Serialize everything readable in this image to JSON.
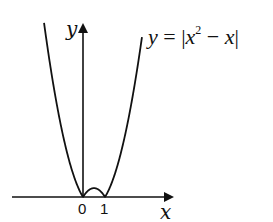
{
  "chart_data": {
    "type": "line",
    "title": "",
    "function": "y = |x^2 - x|",
    "annotation": {
      "text_parts": [
        "y",
        " = |",
        "x",
        "2",
        " − ",
        "x",
        "|"
      ],
      "label": "y = |x² − x|"
    },
    "xlabel": "x",
    "ylabel": "y",
    "x_ticks": [
      {
        "value": 0,
        "label": "0"
      },
      {
        "value": 1,
        "label": "1"
      }
    ],
    "xlim": [
      -3.2,
      4.2
    ],
    "ylim": [
      0,
      4.9
    ],
    "grid": false,
    "legend": "none",
    "series": [
      {
        "name": "y = |x^2 - x|",
        "x": [
          -1.77,
          -1.5,
          -1.0,
          -0.5,
          0,
          0.25,
          0.5,
          0.75,
          1,
          1.5,
          2.0,
          2.5,
          2.68
        ],
        "y": [
          4.9,
          3.75,
          2.0,
          0.75,
          0,
          0.1875,
          0.25,
          0.1875,
          0,
          0.75,
          2.0,
          3.75,
          4.5
        ]
      }
    ],
    "colors": {
      "curve": "#111111",
      "axes": "#111111",
      "background": "#ffffff"
    }
  }
}
